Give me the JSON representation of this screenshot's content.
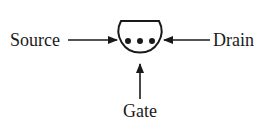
{
  "diagram": {
    "type": "transistor-schematic",
    "labels": {
      "source": "Source",
      "drain": "Drain",
      "gate": "Gate"
    },
    "device": {
      "shape": "circle-with-flat-top",
      "inner_dots": 3
    },
    "arrows": [
      {
        "from": "source",
        "to": "device",
        "direction": "right"
      },
      {
        "from": "drain",
        "to": "device",
        "direction": "left"
      },
      {
        "from": "gate",
        "to": "device",
        "direction": "up"
      }
    ],
    "colors": {
      "stroke": "#1a1a1a",
      "background": "#ffffff"
    }
  }
}
